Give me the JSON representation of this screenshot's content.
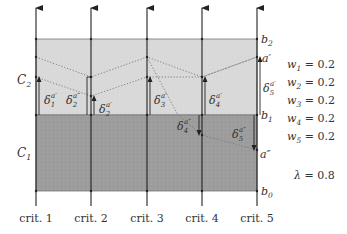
{
  "diagram": {
    "type": "outranking-sorting-model",
    "criteria": [
      "crit. 1",
      "crit. 2",
      "crit. 3",
      "crit. 4",
      "crit. 5"
    ],
    "categories": [
      {
        "label": "C",
        "sub": "2",
        "band": "b1-b2",
        "color": "#d8d8d8"
      },
      {
        "label": "C",
        "sub": "1",
        "band": "b0-b1",
        "color": "#9c9c9c"
      }
    ],
    "boundaries": [
      {
        "label": "b",
        "sub": "2"
      },
      {
        "label": "b",
        "sub": "1"
      },
      {
        "label": "b",
        "sub": "0"
      }
    ],
    "alternatives": [
      {
        "label": "a′"
      },
      {
        "label": "a″"
      }
    ],
    "deltas": [
      {
        "sym": "δ",
        "sub": "1",
        "sup": "a′"
      },
      {
        "sym": "δ",
        "sub": "2",
        "sup": "a″"
      },
      {
        "sym": "δ",
        "sub": "2",
        "sup": "a′"
      },
      {
        "sym": "δ",
        "sub": "3",
        "sup": "a′"
      },
      {
        "sym": "δ",
        "sub": "4",
        "sup": "a′"
      },
      {
        "sym": "δ",
        "sub": "5",
        "sup": "a′"
      },
      {
        "sym": "δ",
        "sub": "4",
        "sup": "a″"
      },
      {
        "sym": "δ",
        "sub": "5",
        "sup": "a″"
      }
    ],
    "weights": [
      {
        "var": "w",
        "sub": "1",
        "eq": "= 0.2"
      },
      {
        "var": "w",
        "sub": "2",
        "eq": "= 0.2"
      },
      {
        "var": "w",
        "sub": "3",
        "eq": "= 0.2"
      },
      {
        "var": "w",
        "sub": "4",
        "eq": "= 0.2"
      },
      {
        "var": "w",
        "sub": "5",
        "eq": "= 0.2"
      }
    ],
    "lambda": {
      "var": "λ",
      "eq": "= 0.8"
    },
    "colors": {
      "upper_band": "#d8d8d8",
      "lower_band": "#9c9c9c",
      "axis": "#222222",
      "dotted": "#777777"
    }
  }
}
